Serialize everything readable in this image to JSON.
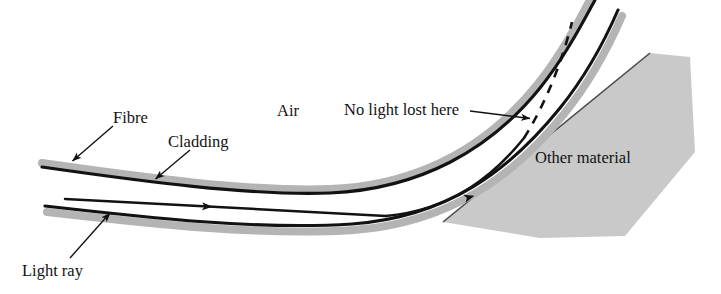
{
  "figure": {
    "type": "physics-ray-diagram",
    "width": 721,
    "height": 294,
    "background_color": "#ffffff"
  },
  "colors": {
    "stroke": "#121212",
    "cladding_gray": "#b4b4b4",
    "material_gray": "#c9c9c9",
    "material_edge": "#4a4a4a",
    "background": "#ffffff"
  },
  "labels": {
    "fibre": "Fibre",
    "cladding": "Cladding",
    "air": "Air",
    "no_light_lost": "No light lost here",
    "other_material": "Other material",
    "light_ray": "Light ray"
  },
  "geometry": {
    "fibre_top_wall": "M42,167 C140,181 250,196 330,193 C420,189 490,150 540,88 C565,57 583,22 595,0",
    "fibre_bottom_wall": "M45,206 C150,218 260,230 352,224 C448,217 510,170 560,108 C585,77 605,40 618,10",
    "cladding_top_band": "M42,163 C140,177 250,192 330,189 C420,185 487,147 537,85 C562,54 580,19 592,-4",
    "cladding_bottom_band": "M47,212 C152,224 262,236 354,230 C450,223 514,176 564,114 C589,83 609,46 622,16",
    "ray_segment_1": "M65,199 L386,216",
    "ray_segment_2": "M386,216 C450,210 492,178 524,138",
    "ray_exit_point": [
      524,
      138
    ],
    "dashed_continuation": "M524,138 C545,105 562,62 572,22",
    "arrow_ray_mid": [
      206,
      210
    ],
    "arrow_ray_upper": [
      468,
      196
    ],
    "material_polygon": "650,53 690,57 695,152 625,236 540,238 443,222",
    "material_top_edge": "M443,222 L650,53"
  },
  "annotations": [
    {
      "name": "fibre",
      "leader": "M113,126 L70,163",
      "arrow_at": [
        70,
        163
      ],
      "angle_deg": 220
    },
    {
      "name": "cladding",
      "leader": "M190,150 L153,181",
      "arrow_at": [
        153,
        181
      ],
      "angle_deg": 220
    },
    {
      "name": "light-ray",
      "leader": "M70,258 L112,211",
      "arrow_at": [
        112,
        211
      ],
      "angle_deg": 312
    },
    {
      "name": "no-light-lost-here",
      "leader": "M470,111 L532,119",
      "arrow_at": [
        532,
        119
      ],
      "angle_deg": 8
    }
  ]
}
